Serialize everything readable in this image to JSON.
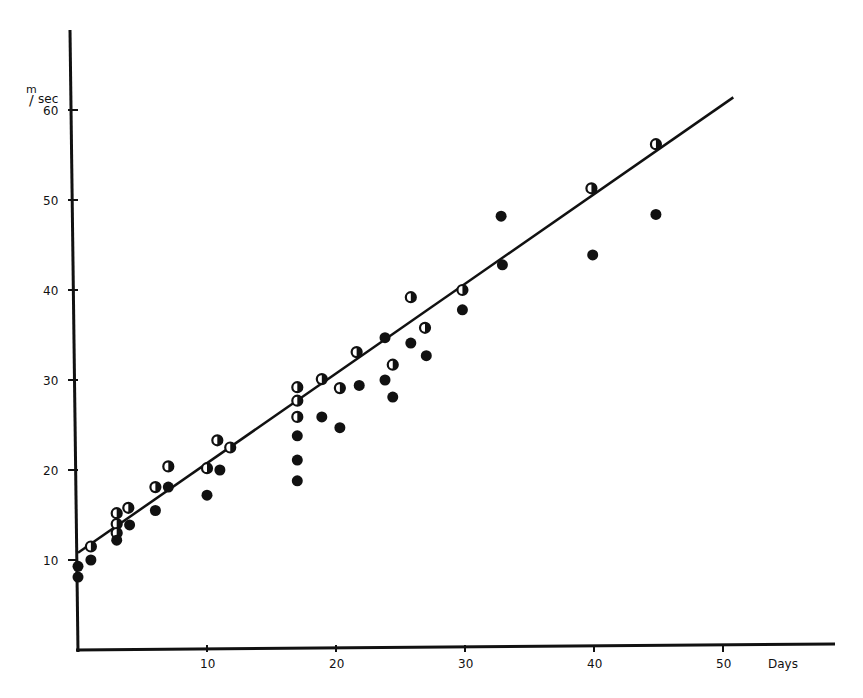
{
  "chart_data": {
    "type": "scatter",
    "title": "",
    "xlabel": "Days",
    "ylabel": "m/sec",
    "ylabel_num": "m",
    "ylabel_den": "sec",
    "xlim": [
      0,
      55
    ],
    "ylim": [
      0,
      65
    ],
    "x_ticks": [
      10,
      20,
      30,
      40,
      50
    ],
    "y_ticks": [
      10,
      20,
      30,
      40,
      50,
      60
    ],
    "grid": false,
    "legend": null,
    "series": [
      {
        "name": "half-filled markers",
        "marker": "half-open-circle",
        "points": [
          [
            1,
            11.5
          ],
          [
            3,
            15.2
          ],
          [
            3,
            14
          ],
          [
            3,
            13
          ],
          [
            3.9,
            15.8
          ],
          [
            6,
            18.1
          ],
          [
            7,
            20.4
          ],
          [
            10,
            20.2
          ],
          [
            10.8,
            23.3
          ],
          [
            11.8,
            22.5
          ],
          [
            17,
            29.2
          ],
          [
            17,
            27.7
          ],
          [
            17,
            25.9
          ],
          [
            18.9,
            30.1
          ],
          [
            20.3,
            29.1
          ],
          [
            21.6,
            33.1
          ],
          [
            24.4,
            31.7
          ],
          [
            26.9,
            35.8
          ],
          [
            25.8,
            39.2
          ],
          [
            29.8,
            40
          ],
          [
            39.8,
            51.3
          ],
          [
            44.8,
            56.2
          ]
        ]
      },
      {
        "name": "filled markers",
        "marker": "filled-circle",
        "points": [
          [
            0,
            9.3
          ],
          [
            0,
            8.1
          ],
          [
            1,
            10
          ],
          [
            3,
            12.2
          ],
          [
            4,
            13.9
          ],
          [
            6,
            15.5
          ],
          [
            7,
            18.1
          ],
          [
            10,
            17.2
          ],
          [
            11,
            20
          ],
          [
            17,
            23.8
          ],
          [
            17,
            21.1
          ],
          [
            17,
            18.8
          ],
          [
            18.9,
            25.9
          ],
          [
            20.3,
            24.7
          ],
          [
            21.8,
            29.4
          ],
          [
            23.8,
            34.7
          ],
          [
            23.8,
            30
          ],
          [
            24.4,
            28.1
          ],
          [
            25.8,
            34.1
          ],
          [
            27,
            32.7
          ],
          [
            29.8,
            37.8
          ],
          [
            32.8,
            48.2
          ],
          [
            32.9,
            42.8
          ],
          [
            39.9,
            43.9
          ],
          [
            44.8,
            48.4
          ]
        ]
      }
    ],
    "regression_line": {
      "x": [
        0,
        50.8
      ],
      "y": [
        10.8,
        61.4
      ]
    }
  }
}
